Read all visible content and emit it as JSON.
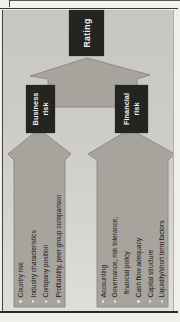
{
  "colors": {
    "page_bg": "#f1efeb",
    "panel_bg": "#cdcbc6",
    "arrow_fill": "#a7a39d",
    "arrow_edge": "#817d76",
    "box_bg": "#242422",
    "box_text": "#f2f1ee",
    "list_text": "#191918",
    "bullet": "#eae8e3",
    "frame_line": "#3a3834"
  },
  "rating_box": {
    "label": "Rating"
  },
  "business_box": {
    "line1": "Business",
    "line2": "risk"
  },
  "financial_box": {
    "line1": "Financial",
    "line2": "risk"
  },
  "business_factors": {
    "items": [
      {
        "text": "Country risk"
      },
      {
        "text": "Industry characteristics"
      },
      {
        "text": "Company position"
      },
      {
        "text": "Profitability, peer group comparison"
      }
    ]
  },
  "financial_factors": {
    "items": [
      {
        "text": "Accounting"
      },
      {
        "text": "Governance, risk tolerance,"
      },
      {
        "text": "financial policy"
      },
      {
        "text": "Cash flow adequacy"
      },
      {
        "text": "Capital structure"
      },
      {
        "text": "Liquidity/short term factors"
      }
    ]
  }
}
